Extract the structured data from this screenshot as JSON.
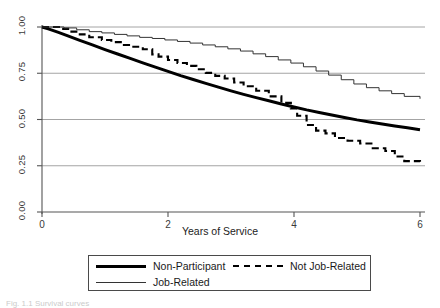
{
  "chart_data": {
    "type": "line",
    "title": "",
    "xlabel": "Years of Service",
    "ylabel": "",
    "xlim": [
      0,
      6
    ],
    "ylim": [
      0,
      1.0
    ],
    "xticks": [
      "0",
      "2",
      "4",
      "6"
    ],
    "xtick_values": [
      0,
      2,
      4,
      6
    ],
    "yticks": [
      "0.00",
      "0.25",
      "0.50",
      "0.75",
      "1.00"
    ],
    "ytick_values": [
      0.0,
      0.25,
      0.5,
      0.75,
      1.0
    ],
    "grid": "horizontal",
    "legend_position": "below-axis",
    "series": [
      {
        "name": "Non-Participant",
        "style": "solid-thick",
        "color": "#000000",
        "x": [
          0.0,
          0.1,
          0.25,
          0.4,
          0.6,
          0.8,
          1.0,
          1.2,
          1.4,
          1.6,
          1.8,
          2.0,
          2.2,
          2.4,
          2.6,
          2.8,
          3.0,
          3.2,
          3.4,
          3.6,
          3.8,
          4.0,
          4.2,
          4.4,
          4.6,
          4.8,
          5.0,
          5.2,
          5.4,
          5.6,
          5.8,
          6.0
        ],
        "y": [
          1.0,
          0.99,
          0.972,
          0.953,
          0.928,
          0.903,
          0.878,
          0.854,
          0.83,
          0.806,
          0.783,
          0.76,
          0.737,
          0.716,
          0.695,
          0.675,
          0.655,
          0.636,
          0.618,
          0.601,
          0.584,
          0.568,
          0.552,
          0.538,
          0.524,
          0.511,
          0.498,
          0.487,
          0.476,
          0.465,
          0.455,
          0.445
        ]
      },
      {
        "name": "Not Job-Related",
        "style": "dashed",
        "color": "#000000",
        "x": [
          0.0,
          0.3,
          0.45,
          0.6,
          0.75,
          0.95,
          1.1,
          1.3,
          1.45,
          1.6,
          1.75,
          1.85,
          2.0,
          2.15,
          2.3,
          2.45,
          2.6,
          2.75,
          2.9,
          3.05,
          3.2,
          3.4,
          3.6,
          3.8,
          3.95,
          4.05,
          4.2,
          4.35,
          4.5,
          4.65,
          4.85,
          5.05,
          5.25,
          5.45,
          5.6,
          5.75,
          6.0
        ],
        "y": [
          1.0,
          0.99,
          0.975,
          0.96,
          0.945,
          0.93,
          0.918,
          0.903,
          0.893,
          0.88,
          0.852,
          0.84,
          0.822,
          0.805,
          0.79,
          0.772,
          0.752,
          0.736,
          0.722,
          0.7,
          0.68,
          0.655,
          0.625,
          0.59,
          0.56,
          0.52,
          0.47,
          0.44,
          0.425,
          0.4,
          0.385,
          0.37,
          0.345,
          0.33,
          0.3,
          0.275,
          0.272
        ]
      },
      {
        "name": "Job-Related",
        "style": "solid-thin",
        "color": "#333333",
        "x": [
          0.0,
          0.35,
          0.55,
          0.75,
          0.95,
          1.15,
          1.35,
          1.55,
          1.75,
          1.95,
          2.15,
          2.35,
          2.55,
          2.75,
          2.95,
          3.15,
          3.35,
          3.55,
          3.75,
          3.95,
          4.15,
          4.35,
          4.55,
          4.75,
          4.95,
          5.15,
          5.35,
          5.55,
          5.75,
          6.0
        ],
        "y": [
          1.0,
          0.995,
          0.985,
          0.975,
          0.968,
          0.96,
          0.952,
          0.944,
          0.938,
          0.93,
          0.922,
          0.913,
          0.903,
          0.893,
          0.882,
          0.87,
          0.855,
          0.84,
          0.822,
          0.805,
          0.785,
          0.762,
          0.74,
          0.715,
          0.692,
          0.672,
          0.655,
          0.64,
          0.625,
          0.612
        ]
      }
    ]
  },
  "axis": {
    "x_title": "Years of Service"
  },
  "legend": {
    "items": [
      {
        "label": "Non-Participant",
        "style": "solid-thick"
      },
      {
        "label": "Not Job-Related",
        "style": "dashed"
      },
      {
        "label": "Job-Related",
        "style": "solid-thin"
      }
    ]
  },
  "caption": {
    "text": "Fig. 1.1  Survival curves"
  }
}
